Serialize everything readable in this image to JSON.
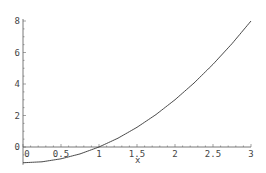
{
  "chart_data": {
    "type": "line",
    "title": "",
    "xlabel": "x",
    "ylabel": "",
    "xlim": [
      0,
      3
    ],
    "ylim": [
      -1,
      8
    ],
    "grid": false,
    "x_ticks": [
      0,
      0.5,
      1,
      1.5,
      2,
      2.5,
      3
    ],
    "x_tick_labels": [
      "0",
      "0.5",
      "1",
      "1.5",
      "2",
      "2.5",
      "3"
    ],
    "y_ticks": [
      0,
      2,
      4,
      6,
      8
    ],
    "y_tick_labels": [
      "0",
      "2",
      "4",
      "6",
      "8"
    ],
    "series": [
      {
        "name": "f(x) = x^2 - 1",
        "x": [
          0,
          0.25,
          0.5,
          0.75,
          1,
          1.25,
          1.5,
          1.75,
          2,
          2.25,
          2.5,
          2.75,
          3
        ],
        "y": [
          -1,
          -0.94,
          -0.75,
          -0.44,
          0,
          0.56,
          1.25,
          2.06,
          3,
          4.06,
          5.25,
          6.56,
          8
        ]
      }
    ]
  },
  "axis_label_x": "x"
}
